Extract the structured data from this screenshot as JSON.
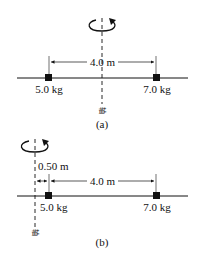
{
  "diagrams": [
    {
      "caption": "(a)",
      "distance_label": "4.0 m",
      "mass_left_label": "5.0 kg",
      "mass_right_label": "7.0 kg",
      "axis_label": "轴"
    },
    {
      "caption": "(b)",
      "offset_label": "0.50 m",
      "distance_label": "4.0 m",
      "mass_left_label": "5.0 kg",
      "mass_right_label": "7.0 kg",
      "axis_label": "轴"
    }
  ],
  "colors": {
    "ink": "#111111",
    "background": "#ffffff"
  }
}
